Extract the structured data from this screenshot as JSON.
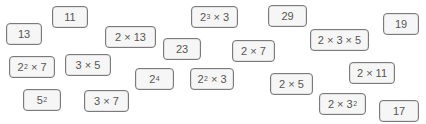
{
  "cards": [
    {
      "id": "c13",
      "base": "13",
      "sup": "",
      "rest": "",
      "x": 6,
      "y": 23,
      "w": 36
    },
    {
      "id": "c11",
      "base": "11",
      "sup": "",
      "rest": "",
      "x": 52,
      "y": 6,
      "w": 36
    },
    {
      "id": "c26",
      "base": "2 × 13",
      "sup": "",
      "rest": "",
      "x": 105,
      "y": 26,
      "w": 51
    },
    {
      "id": "c24",
      "base": "2",
      "sup": "3",
      "rest": " × 3",
      "x": 191,
      "y": 6,
      "w": 47
    },
    {
      "id": "c23",
      "base": "23",
      "sup": "",
      "rest": "",
      "x": 163,
      "y": 38,
      "w": 38
    },
    {
      "id": "c29",
      "base": "29",
      "sup": "",
      "rest": "",
      "x": 268,
      "y": 5,
      "w": 39
    },
    {
      "id": "c14",
      "base": "2 × 7",
      "sup": "",
      "rest": "",
      "x": 232,
      "y": 40,
      "w": 43
    },
    {
      "id": "c30",
      "base": "2 × 3 × 5",
      "sup": "",
      "rest": "",
      "x": 310,
      "y": 29,
      "w": 59
    },
    {
      "id": "c19",
      "base": "19",
      "sup": "",
      "rest": "",
      "x": 383,
      "y": 13,
      "w": 36
    },
    {
      "id": "c28",
      "base": "2",
      "sup": "2",
      "rest": " × 7",
      "x": 9,
      "y": 56,
      "w": 46
    },
    {
      "id": "c15",
      "base": "3 × 5",
      "sup": "",
      "rest": "",
      "x": 65,
      "y": 54,
      "w": 46
    },
    {
      "id": "c16",
      "base": "2",
      "sup": "4",
      "rest": "",
      "x": 135,
      "y": 68,
      "w": 39
    },
    {
      "id": "c12",
      "base": "2",
      "sup": "2",
      "rest": " × 3",
      "x": 190,
      "y": 68,
      "w": 44
    },
    {
      "id": "c22",
      "base": "2 × 11",
      "sup": "",
      "rest": "",
      "x": 349,
      "y": 62,
      "w": 46
    },
    {
      "id": "c10",
      "base": "2 × 5",
      "sup": "",
      "rest": "",
      "x": 270,
      "y": 73,
      "w": 43
    },
    {
      "id": "c25",
      "base": "5",
      "sup": "2",
      "rest": "",
      "x": 23,
      "y": 89,
      "w": 38
    },
    {
      "id": "c21",
      "base": "3 × 7",
      "sup": "",
      "rest": "",
      "x": 84,
      "y": 90,
      "w": 45
    },
    {
      "id": "c18",
      "base": "2 × 3",
      "sup": "2",
      "rest": "",
      "x": 319,
      "y": 93,
      "w": 47
    },
    {
      "id": "c17",
      "base": "17",
      "sup": "",
      "rest": "",
      "x": 379,
      "y": 100,
      "w": 40
    }
  ]
}
